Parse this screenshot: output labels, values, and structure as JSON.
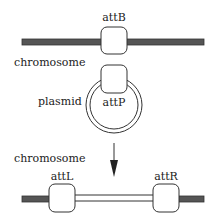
{
  "top": {
    "site_label": "attB",
    "chromosome_label": "chromosome",
    "plasmid_label": "plasmid",
    "plasmid_site_label": "attP"
  },
  "bottom": {
    "chromosome_label": "chromosome",
    "left_site_label": "attL",
    "right_site_label": "attR"
  },
  "icons": {
    "arrow": "arrow-down-icon"
  },
  "colors": {
    "chromosome_fill": "#555555",
    "outline": "#333333",
    "background": "#ffffff"
  }
}
